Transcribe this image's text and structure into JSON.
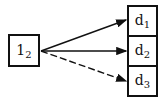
{
  "diagram": {
    "source_node": {
      "base": "1",
      "subscript": "2"
    },
    "target_nodes": [
      {
        "base": "d",
        "subscript": "1",
        "edge_style": "solid"
      },
      {
        "base": "d",
        "subscript": "2",
        "edge_style": "solid"
      },
      {
        "base": "d",
        "subscript": "3",
        "edge_style": "dashed"
      }
    ],
    "colors": {
      "stroke": "#111111",
      "background": "#ffffff"
    }
  }
}
